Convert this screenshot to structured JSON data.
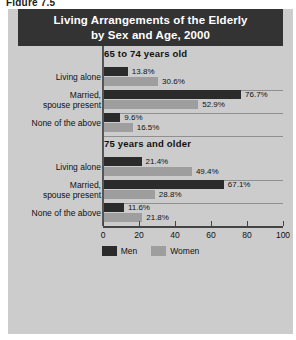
{
  "figure_caption": "Figure 7.5",
  "title": {
    "line1": "Living Arrangements of the Elderly",
    "line2": "by Sex and Age, 2000"
  },
  "colors": {
    "men": "#2b2b2b",
    "women": "#9e9e9e",
    "title_bar": "#333333",
    "panel": "#cccccc"
  },
  "legend": {
    "position": "bottom-center",
    "items": [
      {
        "label": "Men",
        "color": "#2b2b2b"
      },
      {
        "label": "Women",
        "color": "#9e9e9e"
      }
    ]
  },
  "axis": {
    "ticks": [
      "0",
      "20",
      "40",
      "60",
      "80",
      "100"
    ],
    "min": 0,
    "max": 100
  },
  "chart_data": {
    "type": "bar",
    "orientation": "horizontal",
    "title": "Living Arrangements of the Elderly by Sex and Age, 2000",
    "xlabel": "",
    "ylabel": "",
    "xlim": [
      0,
      100
    ],
    "grid": true,
    "legend_position": "bottom-center",
    "value_suffix": "%",
    "series": [
      {
        "name": "Men",
        "color": "#2b2b2b"
      },
      {
        "name": "Women",
        "color": "#9e9e9e"
      }
    ],
    "groups": [
      {
        "heading": "65 to 74 years old",
        "categories": [
          {
            "label_lines": [
              "Living alone"
            ],
            "men": 13.8,
            "women": 30.6,
            "men_label": "13.8%",
            "women_label": "30.6%"
          },
          {
            "label_lines": [
              "Married,",
              "spouse present"
            ],
            "men": 76.7,
            "women": 52.9,
            "men_label": "76.7%",
            "women_label": "52.9%"
          },
          {
            "label_lines": [
              "None of the above"
            ],
            "men": 9.6,
            "women": 16.5,
            "men_label": "9.6%",
            "women_label": "16.5%"
          }
        ]
      },
      {
        "heading": "75 years and older",
        "categories": [
          {
            "label_lines": [
              "Living alone"
            ],
            "men": 21.4,
            "women": 49.4,
            "men_label": "21.4%",
            "women_label": "49.4%"
          },
          {
            "label_lines": [
              "Married,",
              "spouse present"
            ],
            "men": 67.1,
            "women": 28.8,
            "men_label": "67.1%",
            "women_label": "28.8%"
          },
          {
            "label_lines": [
              "None of the above"
            ],
            "men": 11.6,
            "women": 21.8,
            "men_label": "11.6%",
            "women_label": "21.8%"
          }
        ]
      }
    ]
  }
}
